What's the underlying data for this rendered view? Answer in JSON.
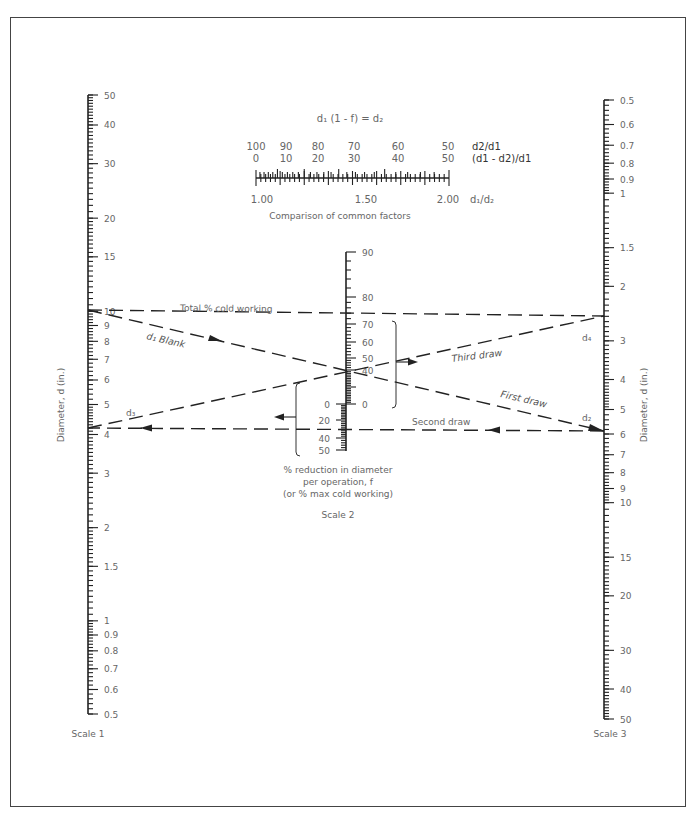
{
  "formula": "d₁ (1 - f) = d₂",
  "comparison": {
    "top_row_values": [
      "100",
      "90",
      "80",
      "70",
      "60",
      "50"
    ],
    "top_row_label": "d2/d1",
    "second_row_values": [
      "0",
      "10",
      "20",
      "30",
      "40",
      "50"
    ],
    "second_row_label": "(d1 - d2)/d1",
    "bottom_values": [
      "1.00",
      "1.50",
      "2.00"
    ],
    "bottom_label": "d₁/d₂",
    "caption": "Comparison of common factors"
  },
  "scale1": {
    "axis_label": "Diameter, d (in.)",
    "name": "Scale 1",
    "tick_labels": [
      "50",
      "40",
      "30",
      "20",
      "15",
      "10",
      "9",
      "8",
      "7",
      "6",
      "5",
      "4",
      "3",
      "2",
      "1.5",
      "1",
      "0.9",
      "0.8",
      "0.7",
      "0.6",
      "0.5"
    ]
  },
  "scale2": {
    "caption_line1": "% reduction in diameter",
    "caption_line2": "per operation, f",
    "caption_line3": "(or % max cold working)",
    "name": "Scale 2",
    "upper_tick_labels": [
      "90",
      "80",
      "70",
      "60",
      "50",
      "40",
      "20",
      "0"
    ],
    "lower_tick_labels": [
      "0",
      "20",
      "40",
      "50"
    ]
  },
  "scale3": {
    "axis_label": "Diameter, d (in.)",
    "name": "Scale 3",
    "tick_labels": [
      "0.5",
      "0.6",
      "0.7",
      "0.8",
      "0.9",
      "1",
      "1.5",
      "2",
      "3",
      "4",
      "5",
      "6",
      "7",
      "8",
      "9",
      "10",
      "15",
      "20",
      "30",
      "40",
      "50"
    ]
  },
  "annotations": {
    "total_cold_working": "Total % cold working",
    "d1_blank": "d₁ Blank",
    "first_draw": "First draw",
    "second_draw": "Second draw",
    "third_draw": "Third draw",
    "d2": "d₂",
    "d3": "d₃",
    "d4": "d₄"
  },
  "chart_data": {
    "type": "nomogram",
    "scales": [
      {
        "name": "Scale 1",
        "label": "Diameter, d (in.)",
        "type": "log",
        "range": [
          0.5,
          50
        ],
        "direction": "top=50"
      },
      {
        "name": "Scale 2",
        "label": "% reduction in diameter per operation, f (or % max cold working)",
        "upper_range": [
          0,
          90
        ],
        "lower_range": [
          0,
          50
        ]
      },
      {
        "name": "Scale 3",
        "label": "Diameter, d (in.)",
        "type": "log",
        "range": [
          0.5,
          50
        ],
        "direction": "top=0.5"
      }
    ],
    "example_lines": [
      {
        "label": "Total % cold working",
        "from": {
          "scale": 1,
          "d": 9.5
        },
        "to": {
          "scale": 3,
          "d": 2.9
        },
        "scale2_reading": 69
      },
      {
        "label": "First draw",
        "from": {
          "scale": 1,
          "d": 9.5
        },
        "to": {
          "scale": 3,
          "d": 5.9
        },
        "scale2_reading": 38
      },
      {
        "label": "Second draw",
        "from": {
          "scale": 3,
          "d": 5.9
        },
        "to": {
          "scale": 1,
          "d": 4.2
        },
        "scale2_reading": 28
      },
      {
        "label": "Third draw",
        "from": {
          "scale": 1,
          "d": 4.2
        },
        "to": {
          "scale": 3,
          "d": 2.9
        },
        "scale2_reading": 30
      }
    ],
    "comparison_scale": {
      "d1_over_d2": [
        1.0,
        1.5,
        2.0
      ],
      "d2_over_d1_pct": [
        100,
        90,
        80,
        70,
        60,
        50
      ],
      "reduction_pct": [
        0,
        10,
        20,
        30,
        40,
        50
      ]
    }
  }
}
